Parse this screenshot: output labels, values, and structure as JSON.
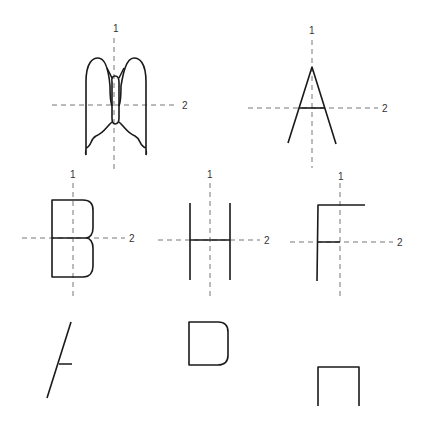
{
  "figures": [
    {
      "id": "butterfly",
      "axis_labels": [
        "1",
        "2"
      ]
    },
    {
      "id": "letter-a",
      "axis_labels": [
        "1",
        "2"
      ]
    },
    {
      "id": "letter-b",
      "axis_labels": [
        "1",
        "2"
      ]
    },
    {
      "id": "letter-h",
      "axis_labels": [
        "1",
        "2"
      ]
    },
    {
      "id": "letter-f",
      "axis_labels": [
        "1",
        "2"
      ]
    }
  ],
  "colors": {
    "stroke": "#1a1a1a",
    "axis": "#777777"
  }
}
